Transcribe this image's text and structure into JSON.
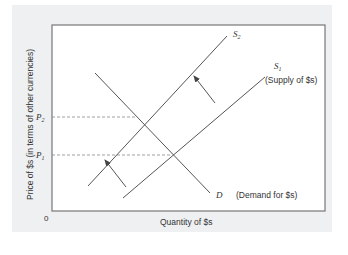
{
  "figure": {
    "y_axis_label": "Price of $s (in terms of other currencies)",
    "x_axis_label": "Quantity of $s",
    "origin_label": "0",
    "price_labels": {
      "p2": {
        "main": "P",
        "sub": "2"
      },
      "p1": {
        "main": "P",
        "sub": "1"
      }
    },
    "curves": {
      "s2": {
        "main": "S",
        "sub": "2"
      },
      "s1": {
        "main": "S",
        "sub": "1",
        "description": "(Supply of $s)"
      },
      "d": {
        "main": "D",
        "description": "(Demand for $s)"
      }
    },
    "colors": {
      "panel_bg": "#eef0f1",
      "plot_bg": "#ffffff",
      "line": "#555555",
      "text": "#333333"
    }
  }
}
